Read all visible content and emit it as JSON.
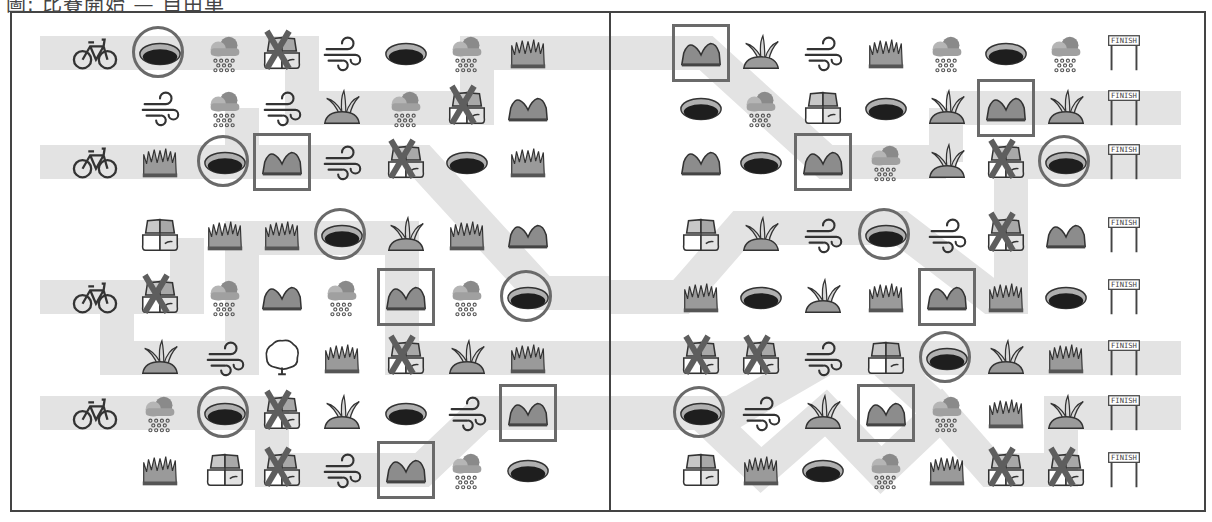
{
  "title": "圖: 比賽開始 — 自由車",
  "colors": {
    "path": "#e3e3e3",
    "frame": "#444444",
    "mark": "#6a6a6a"
  },
  "left_panel": {
    "rows": [
      [
        "bike",
        "hole:circle",
        "rain",
        "rocks:x",
        "wind",
        "hole",
        "rain",
        "grass"
      ],
      [
        "",
        "wind",
        "rain",
        "wind",
        "bush",
        "rain",
        "rocks:x",
        "hill"
      ],
      [
        "bike",
        "grass",
        "hole:circle",
        "hill:square",
        "wind",
        "rocks:x",
        "hole",
        "grass"
      ],
      [
        "",
        "rocks",
        "grass",
        "grass",
        "hole:circle",
        "bush",
        "grass",
        "hill"
      ],
      [
        "bike",
        "rocks:x",
        "rain",
        "hill",
        "rain",
        "hill:square",
        "rain",
        "hole:circle"
      ],
      [
        "",
        "bush",
        "wind",
        "tree",
        "grass",
        "rocks:x",
        "bush",
        "grass"
      ],
      [
        "bike",
        "rain",
        "hole:circle",
        "rocks:x",
        "bush",
        "hole",
        "wind",
        "hill:square"
      ],
      [
        "",
        "grass",
        "rocks",
        "rocks:x",
        "wind",
        "hill:square",
        "rain",
        "hole"
      ]
    ]
  },
  "right_panel": {
    "rows": [
      [
        "hill:square",
        "bush",
        "wind",
        "grass",
        "rain",
        "hole",
        "rain",
        "finish"
      ],
      [
        "hole",
        "rain",
        "rocks",
        "hole",
        "bush",
        "hill:square",
        "bush",
        "finish"
      ],
      [
        "hill",
        "hole",
        "hill:square",
        "rain",
        "bush",
        "rocks:x",
        "hole:circle",
        "finish"
      ],
      [
        "rocks",
        "bush",
        "wind",
        "hole:circle",
        "wind",
        "rocks:x",
        "hill",
        "finish"
      ],
      [
        "grass",
        "hole",
        "bush",
        "grass",
        "hill:square",
        "grass",
        "hole",
        "finish"
      ],
      [
        "rocks:x",
        "rocks:x",
        "wind",
        "rocks",
        "hole:circle",
        "bush",
        "grass",
        "finish"
      ],
      [
        "hole:circle",
        "wind",
        "bush",
        "hill:square",
        "rain",
        "grass",
        "bush",
        "finish"
      ],
      [
        "rocks",
        "grass",
        "hole",
        "rain",
        "grass",
        "rocks:x",
        "rocks:x",
        "finish"
      ]
    ],
    "finish_label": "FINISH"
  }
}
